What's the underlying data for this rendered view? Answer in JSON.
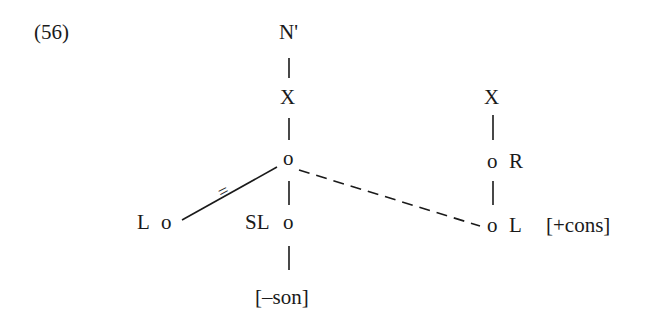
{
  "example_number": "(56)",
  "tree": {
    "left_column": {
      "top": "N'",
      "x": "X",
      "root_node": "o",
      "left_node": {
        "label": "L",
        "node": "o"
      },
      "middle_node": {
        "label": "SL",
        "node": "o"
      },
      "feature": "[–son]",
      "link_mark": "="
    },
    "right_column": {
      "x": "X",
      "r_node": {
        "node": "o",
        "label": "R"
      },
      "l_node": {
        "node": "o",
        "label": "L"
      },
      "feature": "[+cons]"
    }
  }
}
